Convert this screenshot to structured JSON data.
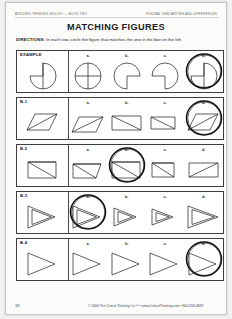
{
  "header": {
    "left": "Building Thinking Skills® — Book Two",
    "right": "Figural Similarities and Differences"
  },
  "title": "MATCHING FIGURES",
  "directions": {
    "label": "DIRECTIONS:",
    "text": " In each row, circle the figure that matches the one in the box on the left."
  },
  "option_labels": [
    "a.",
    "b.",
    "c.",
    "d."
  ],
  "rows": [
    {
      "label": "EXAMPLE",
      "kind": "circle",
      "answer": 3,
      "reference": {
        "notch": "upper-left",
        "chord": "vertical"
      },
      "options": [
        {
          "notch": "none",
          "chord": "cross"
        },
        {
          "notch": "lower-right",
          "chord": "none"
        },
        {
          "notch": "lower-left",
          "chord": "none"
        },
        {
          "notch": "upper-left",
          "chord": "vertical"
        }
      ]
    },
    {
      "label": "B-1",
      "kind": "quad",
      "answer": 3,
      "reference": {
        "shape": "parallelogram-right",
        "diagonal": "bl-tr"
      },
      "options": [
        {
          "shape": "parallelogram-slant",
          "diagonal": "bl-tr"
        },
        {
          "shape": "trapezoid-flat",
          "diagonal": "tl-br"
        },
        {
          "shape": "trapezoid-narrow",
          "diagonal": "tl-br"
        },
        {
          "shape": "parallelogram-right",
          "diagonal": "bl-tr"
        }
      ]
    },
    {
      "label": "B-2",
      "kind": "quad",
      "answer": 1,
      "reference": {
        "shape": "rect-notch",
        "diagonal": "fan-left"
      },
      "options": [
        {
          "shape": "trapezoid-low",
          "diagonal": "fan-left"
        },
        {
          "shape": "rect-notch",
          "diagonal": "fan-left"
        },
        {
          "shape": "rect-small",
          "diagonal": "fan-left"
        },
        {
          "shape": "rect-wide",
          "diagonal": "tl-br"
        }
      ]
    },
    {
      "label": "B-3",
      "kind": "tri",
      "answer": 0,
      "reference": {
        "shape": "right-triangle",
        "inner": "nested-triangle"
      },
      "options": [
        {
          "shape": "right-triangle",
          "inner": "nested-triangle"
        },
        {
          "shape": "right-triangle-small",
          "inner": "nested-triangle"
        },
        {
          "shape": "right-triangle-thin",
          "inner": "nested-triangle"
        },
        {
          "shape": "right-triangle-wide",
          "inner": "nested-triangle"
        }
      ]
    },
    {
      "label": "B-4",
      "kind": "tri",
      "answer": 3,
      "reference": {
        "shape": "arrow-triangle",
        "inner": "bar-and-split"
      },
      "options": [
        {
          "shape": "arrow-triangle",
          "inner": "bar-and-split"
        },
        {
          "shape": "arrow-triangle-small",
          "inner": "bar-and-split"
        },
        {
          "shape": "arrow-triangle-wide",
          "inner": "bar-and-split"
        },
        {
          "shape": "arrow-triangle",
          "inner": "bar-and-split"
        }
      ]
    }
  ],
  "footer": {
    "page_number": "18",
    "credit": "© 2006 The Critical Thinking Co.™ • www.CriticalThinking.com • 800-458-4849"
  },
  "colors": {
    "page_background": "#f2f1ef",
    "sheet": "#fbfbfa",
    "ink": "#1b1b1b",
    "line": "#3d3d3d",
    "mark": "#111111"
  }
}
